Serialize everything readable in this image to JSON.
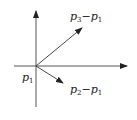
{
  "diagram": {
    "colors": {
      "stroke": "#333333",
      "text": "#222222",
      "background": "#ffffff"
    },
    "origin_label": {
      "base": "p",
      "sub": "1"
    },
    "vectors": [
      {
        "name": "p3-p1",
        "label": {
          "a": "p",
          "a_sub": "3",
          "op": "−",
          "b": "p",
          "b_sub": "1"
        }
      },
      {
        "name": "p2-p1",
        "label": {
          "a": "p",
          "a_sub": "2",
          "op": "−",
          "b": "p",
          "b_sub": "1"
        }
      }
    ],
    "axes": [
      "vertical-axis",
      "horizontal-axis"
    ]
  }
}
